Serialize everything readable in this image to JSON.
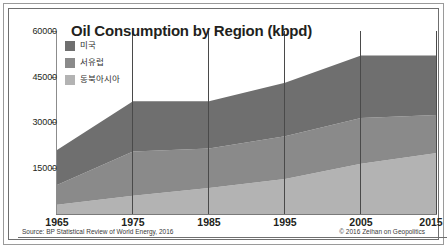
{
  "chart_data": {
    "type": "area",
    "stacked": true,
    "title": "Oil Consumption by Region (kbpd)",
    "xlabel": "",
    "ylabel": "",
    "x": [
      1965,
      1975,
      1985,
      1995,
      2005,
      2015
    ],
    "xtick_labels": [
      "1965",
      "1975",
      "1985",
      "1995",
      "2005",
      "2015"
    ],
    "xlim": [
      1965,
      2015
    ],
    "ylim": [
      0,
      60000
    ],
    "ytick_labels": [
      "60000",
      "45000",
      "30000",
      "15000"
    ],
    "yticks": [
      60000,
      45000,
      30000,
      15000
    ],
    "grid": "vertical",
    "legend_position": "top-left",
    "series": [
      {
        "name": "미국",
        "color": "#6f6f6f",
        "values": [
          11500,
          16500,
          15500,
          17500,
          20500,
          19500
        ]
      },
      {
        "name": "서유럽",
        "color": "#8a8a8a",
        "values": [
          6500,
          14500,
          13000,
          14000,
          15000,
          12500
        ]
      },
      {
        "name": "동북아시아",
        "color": "#b3b3b3",
        "values": [
          3000,
          6000,
          8500,
          11500,
          16500,
          20000
        ]
      }
    ],
    "totals": [
      21000,
      37000,
      37000,
      43000,
      52000,
      52000
    ]
  },
  "legend": {
    "items": [
      {
        "label": "미국",
        "color": "#6f6f6f"
      },
      {
        "label": "서유럽",
        "color": "#8a8a8a"
      },
      {
        "label": "동북아시아",
        "color": "#b3b3b3"
      }
    ]
  },
  "footer": {
    "source": "Source: BP Statistical Review of World Energy, 2016",
    "credit": "© 2016 Zeihan on Geopolitics"
  }
}
